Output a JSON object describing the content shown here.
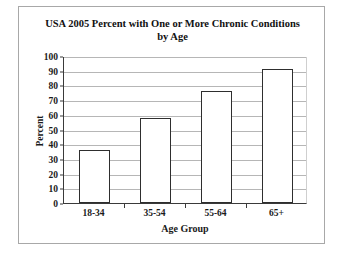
{
  "chart_data": {
    "type": "bar",
    "title": "USA 2005 Percent with One or More Chronic Conditions by Age",
    "title_line1": "USA 2005 Percent with One or More Chronic Conditions",
    "title_line2": "by Age",
    "categories": [
      "18-34",
      "35-54",
      "55-64",
      "65+"
    ],
    "values": [
      36,
      58,
      76,
      91
    ],
    "xlabel": "Age Group",
    "ylabel": "Percent",
    "ylim": [
      0,
      100
    ],
    "ytick_step": 10,
    "yticks": [
      "100",
      "90",
      "80",
      "70",
      "60",
      "50",
      "40",
      "30",
      "20",
      "10",
      "0"
    ],
    "grid": true,
    "legend": false,
    "colors": {
      "bar_fill": "#ffffff",
      "bar_edge": "#2e2e2e",
      "gridline": "#b6b6b6",
      "axis": "#3a3a3a",
      "text": "#1a1a1a",
      "frame": "#a8a8a8",
      "background": "#ffffff"
    }
  }
}
